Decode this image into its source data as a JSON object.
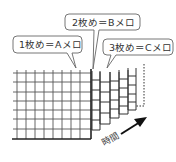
{
  "callouts": [
    {
      "label": "1枚め＝Aメロ"
    },
    {
      "label": "2枚め＝Bメロ"
    },
    {
      "label": "3枚め＝Cメロ"
    }
  ],
  "axis": {
    "time_label": "時間"
  },
  "colors": {
    "line": "#333333",
    "grid": "#555555",
    "bubble_border": "#555555"
  }
}
